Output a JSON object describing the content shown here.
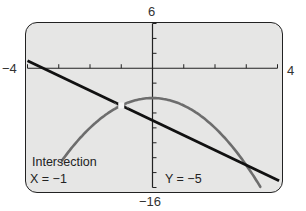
{
  "window": {
    "xmin": "−4",
    "xmax": "4",
    "ymin": "−16",
    "ymax": "6",
    "xscl": 1,
    "yscl": 2
  },
  "readout": {
    "title": "Intersection",
    "x_label": "X = −1",
    "y_label": "Y = −5"
  },
  "colors": {
    "screen_bg": "#e6e6e5",
    "line": "#111111",
    "parabola": "#6d6d6d",
    "axes": "#222222"
  },
  "chart_data": {
    "type": "line",
    "title": "Intersection",
    "xlabel": "",
    "ylabel": "",
    "xlim": [
      -4,
      4
    ],
    "ylim": [
      -16,
      6
    ],
    "grid": false,
    "series": [
      {
        "name": "y = -2x - 7 (line)",
        "x": [
          -4,
          -3,
          -2,
          -1,
          0,
          1,
          2,
          3,
          4
        ],
        "y": [
          1,
          -1,
          -3,
          -5,
          -7,
          -9,
          -11,
          -13,
          -15
        ]
      },
      {
        "name": "y = -x^2 - 4 (parabola)",
        "x": [
          -2.9,
          -2,
          -1,
          0,
          1,
          2,
          3,
          3.4
        ],
        "y": [
          -12.41,
          -8,
          -5,
          -4,
          -5,
          -8,
          -13,
          -15.56
        ]
      }
    ],
    "annotations": [
      {
        "text": "Intersection",
        "x": -1,
        "y": -5
      },
      {
        "text": "X = −1",
        "position": "bottom-left"
      },
      {
        "text": "Y = −5",
        "position": "bottom-center"
      }
    ]
  }
}
